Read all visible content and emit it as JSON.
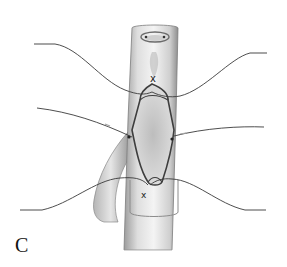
{
  "figure": {
    "panel_label": "C",
    "colors": {
      "background": "#ffffff",
      "vessel_fill": "#d9d9d9",
      "vessel_shadow": "#a8a8a8",
      "suture": "#3a3a3a"
    },
    "sutures": [
      {
        "name": "top-left",
        "position": "upper"
      },
      {
        "name": "top-right",
        "position": "upper"
      },
      {
        "name": "middle-left",
        "position": "middle"
      },
      {
        "name": "middle-right",
        "position": "middle"
      },
      {
        "name": "bottom-left",
        "position": "lower"
      },
      {
        "name": "bottom-right",
        "position": "lower"
      }
    ],
    "knots": [
      "top",
      "bottom"
    ]
  }
}
